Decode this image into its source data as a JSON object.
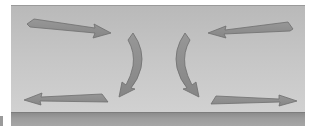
{
  "diagram": {
    "type": "flow-arrows",
    "colors": {
      "panel_top": "#b9b9b9",
      "panel_bottom": "#d3d3d3",
      "floor": "#9c9c9c",
      "arrow_fill": "#8e8e8e",
      "arrow_stroke": "#6f6f6f"
    },
    "arrows": [
      {
        "id": "top-left",
        "shape": "straight",
        "direction": "right",
        "from": [
          27,
          22
        ],
        "to": [
          110,
          33
        ]
      },
      {
        "id": "top-right",
        "shape": "straight",
        "direction": "left",
        "from": [
          293,
          26
        ],
        "to": [
          210,
          33
        ]
      },
      {
        "id": "bottom-left",
        "shape": "straight",
        "direction": "left",
        "from": [
          108,
          98
        ],
        "to": [
          24,
          100
        ]
      },
      {
        "id": "bottom-right",
        "shape": "straight",
        "direction": "right",
        "from": [
          212,
          100
        ],
        "to": [
          296,
          101
        ]
      },
      {
        "id": "center-left-curve",
        "shape": "curved",
        "direction": "down-left",
        "from": [
          129,
          33
        ],
        "to": [
          120,
          95
        ]
      },
      {
        "id": "center-right-curve",
        "shape": "curved",
        "direction": "down-right",
        "from": [
          189,
          33
        ],
        "to": [
          197,
          95
        ]
      }
    ]
  }
}
